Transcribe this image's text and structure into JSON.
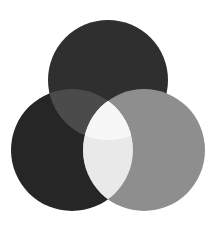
{
  "diagram": {
    "type": "venn",
    "background": "#ffffff",
    "circles": [
      {
        "id": "top",
        "cx": 108,
        "cy": 80,
        "r": 60,
        "fill": "#2f2f2f"
      },
      {
        "id": "left",
        "cx": 72,
        "cy": 150,
        "r": 61,
        "fill": "#262626"
      },
      {
        "id": "right",
        "cx": 144,
        "cy": 150,
        "r": 61,
        "fill": "#8e8e8e"
      }
    ],
    "overlaps": {
      "top_left": "#4b4b4b",
      "left_right": "#e9e9e9",
      "top_left_right": "#f7f7f7"
    }
  }
}
